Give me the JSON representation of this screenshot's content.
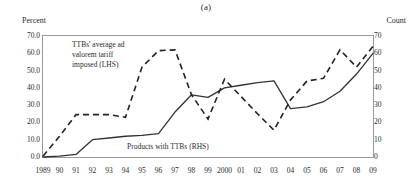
{
  "chart": {
    "title": "(a)",
    "axis_label_left": "Percent",
    "axis_label_right": "Count",
    "annotation_dashed_line1": "TTBs' average ad",
    "annotation_dashed_line2": "valorem tariff",
    "annotation_dashed_line3": "imposed (LHS)",
    "annotation_solid": "Products with TTBs (RHS)",
    "color_line": "#333333",
    "color_frame": "#999999",
    "color_text": "#2b2b2b"
  },
  "chart_data": {
    "type": "line",
    "title": "(a)",
    "xlabel": "",
    "ylabel": "Percent",
    "y2label": "Count",
    "ylim": [
      0,
      70
    ],
    "y2lim": [
      0,
      70
    ],
    "grid": false,
    "legend": "annotations-inline",
    "categories": [
      "1989",
      "90",
      "91",
      "92",
      "93",
      "94",
      "95",
      "96",
      "97",
      "98",
      "99",
      "2000",
      "01",
      "02",
      "03",
      "04",
      "05",
      "06",
      "07",
      "08",
      "09"
    ],
    "x_tick_labels": [
      "1989",
      "90",
      "91",
      "92",
      "93",
      "94",
      "95",
      "96",
      "97",
      "98",
      "99",
      "2000",
      "01",
      "02",
      "03",
      "04",
      "05",
      "06",
      "07",
      "08",
      "09"
    ],
    "y_tick_labels_left": [
      "0.0",
      "10.0",
      "20.0",
      "30.0",
      "40.0",
      "50.0",
      "60.0",
      "70.0"
    ],
    "y_tick_values_left": [
      0,
      10,
      20,
      30,
      40,
      50,
      60,
      70
    ],
    "y_tick_labels_right": [
      "0",
      "10",
      "20",
      "30",
      "40",
      "50",
      "60",
      "70"
    ],
    "y_tick_values_right": [
      0,
      10,
      20,
      30,
      40,
      50,
      60,
      70
    ],
    "series": [
      {
        "name": "TTBs' average ad valorem tariff imposed (LHS)",
        "axis": "left",
        "style": "dashed",
        "unit": "percent",
        "values": [
          0.5,
          12.0,
          24.5,
          24.5,
          24.5,
          23.0,
          52.0,
          61.5,
          62.0,
          36.0,
          22.0,
          45.0,
          35.0,
          25.0,
          15.5,
          33.0,
          44.0,
          45.5,
          62.0,
          52.0,
          64.0
        ]
      },
      {
        "name": "Products with TTBs (RHS)",
        "axis": "right",
        "style": "solid",
        "unit": "count",
        "values": [
          0,
          0.5,
          1.5,
          10,
          11,
          12,
          12.5,
          13.5,
          26,
          36,
          34.5,
          40,
          41.5,
          43,
          44,
          28,
          29,
          32,
          38,
          48,
          60
        ]
      }
    ]
  }
}
